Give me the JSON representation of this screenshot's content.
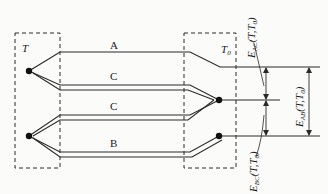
{
  "diagram": {
    "colors": {
      "line": "#2a2a2a",
      "background": "#fbfbfa"
    },
    "regions": [
      {
        "id": "hot-junction-box",
        "label": "T"
      },
      {
        "id": "cold-junction-box",
        "label": "T",
        "label_sub": "0"
      }
    ],
    "wires": [
      {
        "id": "wire-a",
        "label": "A"
      },
      {
        "id": "wire-c-upper",
        "label": "C"
      },
      {
        "id": "wire-c-lower",
        "label": "C"
      },
      {
        "id": "wire-b",
        "label": "B"
      }
    ],
    "emfs": [
      {
        "id": "emf-ac",
        "main": "E",
        "sub": "AC",
        "args": "(T,T",
        "args_sub": "0",
        "close": ")"
      },
      {
        "id": "emf-ab",
        "main": "E",
        "sub": "AB",
        "args": "(T,T",
        "args_sub": "0",
        "close": ")"
      },
      {
        "id": "emf-bc",
        "main": "E",
        "sub": "BC",
        "args": "(T,T",
        "args_sub": "0",
        "close": ")"
      }
    ]
  }
}
